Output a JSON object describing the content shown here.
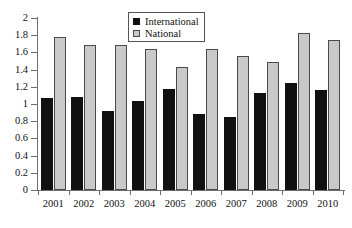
{
  "chart_data": {
    "type": "bar",
    "title": "",
    "subtitle": "",
    "xlabel": "",
    "ylabel": "",
    "categories": [
      "2001",
      "2002",
      "2003",
      "2004",
      "2005",
      "2006",
      "2007",
      "2008",
      "2009",
      "2010"
    ],
    "series": [
      {
        "name": "International",
        "color": "#111111",
        "values": [
          1.07,
          1.08,
          0.92,
          1.03,
          1.17,
          0.88,
          0.85,
          1.13,
          1.25,
          1.16
        ]
      },
      {
        "name": "National",
        "color": "#c9c9c9",
        "values": [
          1.78,
          1.69,
          1.69,
          1.64,
          1.43,
          1.64,
          1.56,
          1.49,
          1.83,
          1.75
        ]
      }
    ],
    "ylim": [
      0,
      2
    ],
    "ytick_values": [
      2,
      1.8,
      1.6,
      1.4,
      1.2,
      1,
      0.8,
      0.6,
      0.4,
      0.2,
      0
    ],
    "ytick_labels": [
      "2",
      "1.8",
      "1.6",
      "1.4",
      "1.2",
      "1",
      "0.8",
      "0.6",
      "0.4",
      "0.2",
      "0"
    ],
    "grid": false,
    "legend_position": "top-center"
  },
  "legend": {
    "items": [
      {
        "label": "International",
        "swatch": "black-square-icon"
      },
      {
        "label": "National",
        "swatch": "gray-square-icon"
      }
    ]
  }
}
